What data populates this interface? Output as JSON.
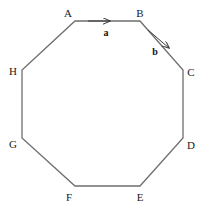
{
  "figure": {
    "shape": "regular-octagon",
    "stroke_color": "#6e6e6e",
    "background_color": "#ffffff",
    "label_color": "#1a1a1a"
  },
  "vertices": [
    {
      "label": "A",
      "x": 75,
      "y": 21,
      "label_x": 68,
      "label_y": 13
    },
    {
      "label": "B",
      "x": 140,
      "y": 21,
      "label_x": 140,
      "label_y": 13
    },
    {
      "label": "C",
      "x": 183,
      "y": 70,
      "label_x": 191,
      "label_y": 72
    },
    {
      "label": "D",
      "x": 183,
      "y": 138,
      "label_x": 191,
      "label_y": 145
    },
    {
      "label": "E",
      "x": 140,
      "y": 186,
      "label_x": 140,
      "label_y": 197
    },
    {
      "label": "F",
      "x": 75,
      "y": 186,
      "label_x": 69,
      "label_y": 197
    },
    {
      "label": "G",
      "x": 22,
      "y": 138,
      "label_x": 13,
      "label_y": 144
    },
    {
      "label": "H",
      "x": 22,
      "y": 70,
      "label_x": 13,
      "label_y": 71
    }
  ],
  "vectors": [
    {
      "label": "a",
      "from": "A",
      "to": "B",
      "arrow_x1": 88,
      "arrow_y1": 21,
      "arrow_x2": 110,
      "arrow_y2": 21,
      "label_x": 106,
      "label_y": 33
    },
    {
      "label": "b",
      "from": "B",
      "to": "C",
      "arrow_x1": 148,
      "arrow_y1": 30,
      "arrow_x2": 169,
      "arrow_y2": 48,
      "label_x": 155,
      "label_y": 52
    }
  ]
}
